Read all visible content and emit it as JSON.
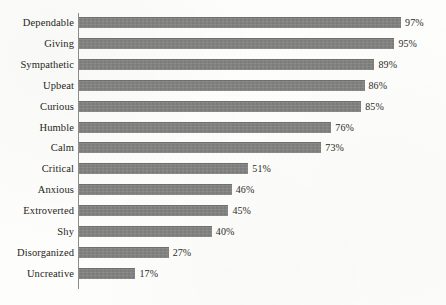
{
  "chart_data": {
    "type": "bar",
    "orientation": "horizontal",
    "title": "",
    "subtitle": "",
    "xlabel": "",
    "ylabel": "",
    "xlim": [
      0,
      100
    ],
    "grid": false,
    "legend": null,
    "value_suffix": "%",
    "categories": [
      "Dependable",
      "Giving",
      "Sympathetic",
      "Upbeat",
      "Curious",
      "Humble",
      "Calm",
      "Critical",
      "Anxious",
      "Extroverted",
      "Shy",
      "Disorganized",
      "Uncreative"
    ],
    "values": [
      97,
      95,
      89,
      86,
      85,
      76,
      73,
      51,
      46,
      45,
      40,
      27,
      17
    ],
    "value_labels": [
      "97%",
      "95%",
      "89%",
      "86%",
      "85%",
      "76%",
      "73%",
      "51%",
      "46%",
      "45%",
      "40%",
      "27%",
      "17%"
    ],
    "bar_color": "#818180",
    "axis_color": "#8b8b88",
    "text_color": "#262622",
    "background_color": "#fdfdfb"
  }
}
